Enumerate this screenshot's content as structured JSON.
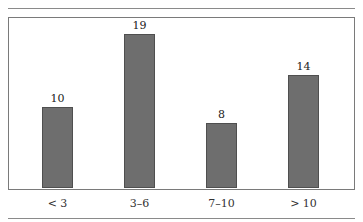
{
  "chart_data": {
    "type": "bar",
    "title": "",
    "xlabel": "",
    "ylabel": "",
    "categories": [
      "< 3",
      "3–6",
      "7–10",
      "> 10"
    ],
    "values": [
      10,
      19,
      8,
      14
    ],
    "data_labels": [
      "10",
      "19",
      "8",
      "14"
    ],
    "ylim": [
      0,
      20
    ],
    "grid": false,
    "legend": null,
    "colors": {
      "bar_fill": "#6e6e6e",
      "bar_edge": "#4f4f4f",
      "frame": "#7a7a7a",
      "rule": "#8a8a8a"
    }
  },
  "header": {
    "clipped_caption": ""
  }
}
